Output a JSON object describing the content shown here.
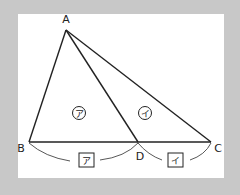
{
  "figure": {
    "background_color": "#c8c8c8",
    "panel_color": "#ffffff",
    "line_color": "#222222",
    "points": {
      "A": {
        "label": "A",
        "x": 66,
        "y": 30
      },
      "B": {
        "label": "B",
        "x": 29,
        "y": 142
      },
      "C": {
        "label": "C",
        "x": 211,
        "y": 142
      },
      "D": {
        "label": "D",
        "x": 138,
        "y": 142
      }
    },
    "segments": [
      "AB",
      "AC",
      "AD",
      "BC"
    ],
    "regions": {
      "left_triangle": {
        "label": "ア",
        "shape": "circle",
        "triangle": "ABD"
      },
      "right_triangle": {
        "label": "イ",
        "shape": "circle",
        "triangle": "ADC"
      }
    },
    "base_segments": {
      "BD": {
        "label": "ア",
        "shape": "box"
      },
      "DC": {
        "label": "イ",
        "shape": "box"
      }
    }
  }
}
